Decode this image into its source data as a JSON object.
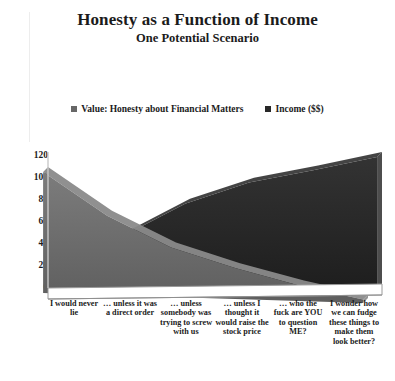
{
  "title": "Honesty as a Function of Income",
  "subtitle": "One Potential Scenario",
  "legend": {
    "items": [
      {
        "label": "Value: Honesty about Financial Matters",
        "color": "#676767",
        "marker": "square-marker"
      },
      {
        "label": "Income ($$)",
        "color": "#282828",
        "marker": "square-marker"
      }
    ]
  },
  "axis": {
    "y_ticks": [
      "120",
      "100",
      "80",
      "60",
      "40",
      "20",
      "0"
    ]
  },
  "chart_data": {
    "type": "area",
    "title": "Honesty as a Function of Income",
    "subtitle": "One Potential Scenario",
    "xlabel": "",
    "ylabel": "",
    "ylim": [
      0,
      120
    ],
    "ytick_step": 20,
    "grid": false,
    "legend_position": "top",
    "three_d": true,
    "categories": [
      "I would never lie",
      "… unless it was a direct order",
      "… unless somebody was trying to screw with us",
      "… unless I thought it would raise the stock price",
      "… who the fuck are YOU to question ME?",
      "I wonder how we can fudge these things to make them look better?"
    ],
    "series": [
      {
        "name": "Value: Honesty about Financial Matters",
        "color": "#676767",
        "values": [
          110,
          72,
          45,
          28,
          14,
          3
        ]
      },
      {
        "name": "Income ($$)",
        "color": "#282828",
        "values": [
          18,
          40,
          72,
          93,
          106,
          120
        ]
      }
    ]
  },
  "colors": {
    "honesty": "#676767",
    "income": "#282828",
    "honesty_side": "#8a8a8a",
    "income_side": "#3a3a3a",
    "floor": "#ffffff",
    "floor_edge": "#8f8f8f",
    "text": "#1b1b1b",
    "background": "#ffffff"
  }
}
